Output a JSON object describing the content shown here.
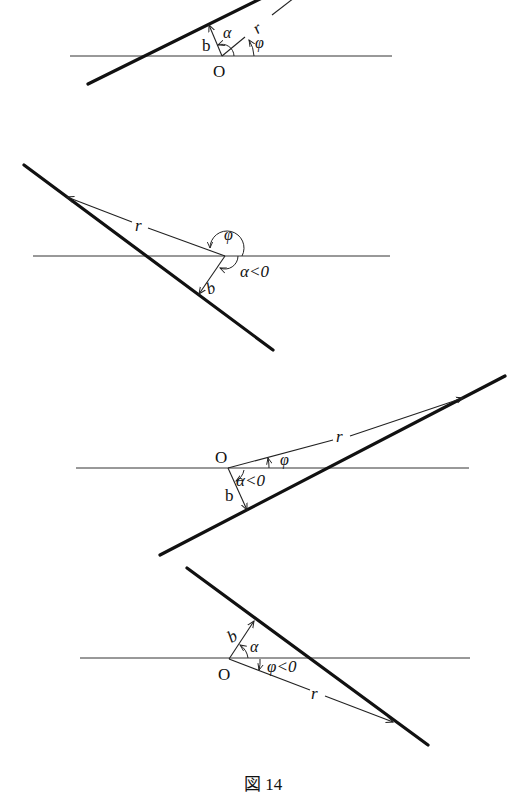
{
  "figure": {
    "caption": "図 14"
  },
  "panels": [
    {
      "id": 1,
      "origin_label": "O",
      "r_label": "r",
      "b_label": "b",
      "alpha_label": "α",
      "phi_label": "φ"
    },
    {
      "id": 2,
      "r_label": "r",
      "b_label": "b",
      "alpha_label": "α<0",
      "phi_label": "φ"
    },
    {
      "id": 3,
      "origin_label": "O",
      "r_label": "r",
      "b_label": "b",
      "alpha_label": "α<0",
      "phi_label": "φ"
    },
    {
      "id": 4,
      "origin_label": "O",
      "r_label": "r",
      "b_label": "b",
      "alpha_label": "α",
      "phi_label": "φ<0"
    }
  ]
}
